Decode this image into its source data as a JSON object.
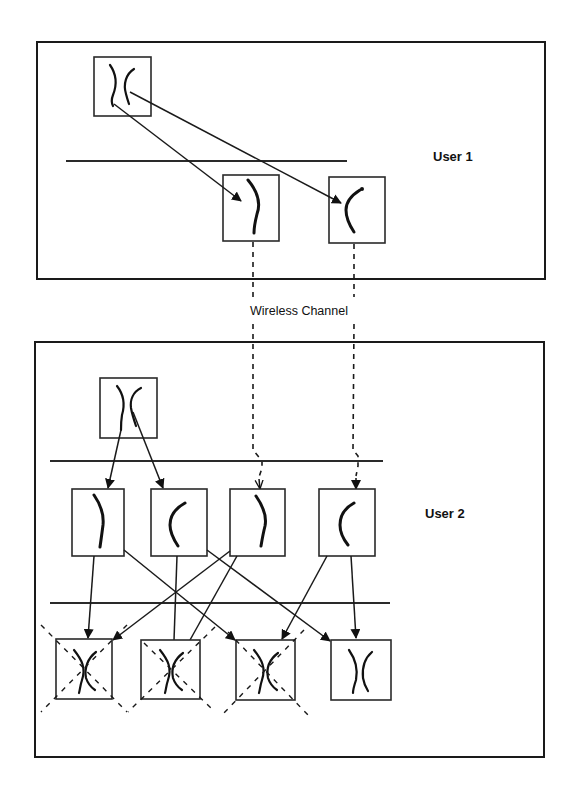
{
  "labels": {
    "user1": "User 1",
    "user2": "User 2",
    "channel": "Wireless Channel"
  },
  "colors": {
    "stroke": "#1a1a1a",
    "background": "#ffffff"
  },
  "panels": [
    {
      "id": "user1-panel",
      "x": 37,
      "y": 42,
      "w": 508,
      "h": 237
    },
    {
      "id": "user2-panel",
      "x": 35,
      "y": 342,
      "w": 509,
      "h": 415
    }
  ],
  "user1": {
    "parent": {
      "x": 94,
      "y": 57,
      "w": 57,
      "h": 59
    },
    "separator": {
      "x1": 66,
      "x2": 347,
      "y": 161
    },
    "children": [
      {
        "x": 223,
        "y": 175,
        "w": 56,
        "h": 66,
        "shape": "right-arc"
      },
      {
        "x": 329,
        "y": 177,
        "w": 56,
        "h": 66,
        "shape": "left-arc"
      }
    ]
  },
  "user2": {
    "parent": {
      "x": 100,
      "y": 378,
      "w": 57,
      "h": 60
    },
    "separator1": {
      "x1": 50,
      "x2": 383,
      "y": 461
    },
    "separator2": {
      "x1": 50,
      "x2": 390,
      "y": 603
    },
    "row2": [
      {
        "x": 72,
        "y": 489,
        "w": 52,
        "h": 67,
        "shape": "right-arc"
      },
      {
        "x": 151,
        "y": 489,
        "w": 56,
        "h": 67,
        "shape": "left-arc"
      },
      {
        "x": 230,
        "y": 489,
        "w": 55,
        "h": 67,
        "shape": "right-arc"
      },
      {
        "x": 319,
        "y": 489,
        "w": 56,
        "h": 67,
        "shape": "left-arc"
      }
    ],
    "row3": [
      {
        "x": 56,
        "y": 639,
        "w": 56,
        "h": 60,
        "crossed": true
      },
      {
        "x": 141,
        "y": 640,
        "w": 59,
        "h": 59,
        "crossed": true
      },
      {
        "x": 236,
        "y": 640,
        "w": 59,
        "h": 60,
        "crossed": true
      },
      {
        "x": 331,
        "y": 640,
        "w": 60,
        "h": 60,
        "crossed": false
      }
    ]
  }
}
